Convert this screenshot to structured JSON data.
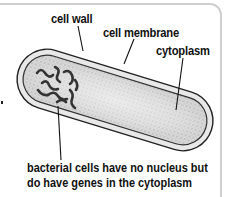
{
  "diagram": {
    "labels": {
      "cell_wall": "cell wall",
      "cell_membrane": "cell membrane",
      "cytoplasm": "cytoplasm"
    },
    "caption": {
      "line1": "bacterial cells have no nucleus but",
      "line2": "do have genes in the cytoplasm"
    },
    "colors": {
      "cell_wall_fill": "#e6e6e6",
      "cytoplasm_fill": "#c9c9c9",
      "outline": "#222222",
      "frame": "#cfcfcf"
    }
  }
}
